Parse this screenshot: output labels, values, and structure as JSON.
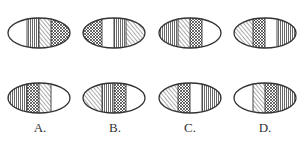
{
  "puzzle": {
    "colors": {
      "stroke": "#333333",
      "background": "#ffffff"
    },
    "top_row": [
      {
        "id": "q1",
        "cx": 39,
        "cy": 33,
        "stripes": [
          "blank",
          "vertical",
          "diagonal",
          "dots"
        ]
      },
      {
        "id": "q2",
        "cx": 114,
        "cy": 33,
        "stripes": [
          "dots",
          "blank",
          "vertical",
          "diagonal"
        ]
      },
      {
        "id": "q3",
        "cx": 190,
        "cy": 33,
        "stripes": [
          "vertical",
          "diagonal",
          "dots",
          "blank"
        ]
      },
      {
        "id": "q4",
        "cx": 265,
        "cy": 33,
        "stripes": [
          "diagonal",
          "dots",
          "blank",
          "vertical"
        ]
      }
    ],
    "options": [
      {
        "label": "A.",
        "cx": 39,
        "cy": 98,
        "label_x": 40,
        "stripes": [
          "vertical",
          "dots",
          "diagonal",
          "blank"
        ]
      },
      {
        "label": "B.",
        "cx": 114,
        "cy": 98,
        "label_x": 115,
        "stripes": [
          "diagonal",
          "vertical",
          "dots",
          "blank"
        ]
      },
      {
        "label": "C.",
        "cx": 190,
        "cy": 98,
        "label_x": 190,
        "stripes": [
          "diagonal",
          "dots",
          "blank",
          "vertical"
        ]
      },
      {
        "label": "D.",
        "cx": 265,
        "cy": 98,
        "label_x": 265,
        "stripes": [
          "blank",
          "diagonal",
          "dots",
          "vertical"
        ]
      }
    ],
    "labels": {
      "a": "A.",
      "b": "B.",
      "c": "C.",
      "d": "D."
    }
  }
}
